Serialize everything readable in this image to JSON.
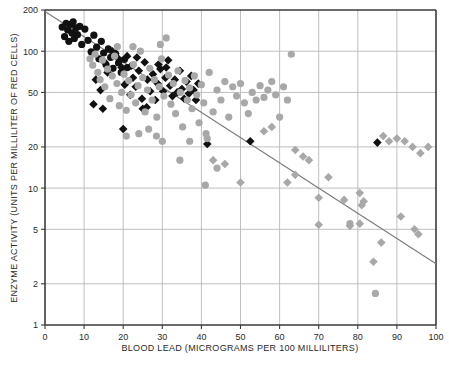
{
  "chart_data": {
    "type": "scatter",
    "title": "",
    "xlabel": "BLOOD LEAD (MICROGRAMS PER 100 MILLILITERS)",
    "ylabel": "ENZYME ACTIVITY (UNITS PER MILLILITER OF RED CELLS)",
    "xscale": "linear",
    "yscale": "log",
    "xlim": [
      0,
      100
    ],
    "ylim": [
      1,
      200
    ],
    "grid": true,
    "legend_position": "none",
    "xticks": [
      0,
      10,
      20,
      30,
      40,
      50,
      60,
      70,
      80,
      90,
      100
    ],
    "xtick_labels": [
      "0",
      "10",
      "20",
      "30",
      "40",
      "50",
      "60",
      "70",
      "80",
      "90",
      "100"
    ],
    "yticks": [
      1,
      2,
      5,
      10,
      20,
      50,
      100,
      200
    ],
    "ytick_labels": [
      "1",
      "2",
      "5",
      "10",
      "20",
      "50",
      "100",
      "200"
    ],
    "colors": {
      "black_marker": "#111111",
      "gray_marker": "#a8a8a8",
      "grid": "#b8b8b8",
      "axis": "#3a3a3a",
      "regression_line": "#7a7a7a",
      "text": "#2b2b2b",
      "background": "#ffffff"
    },
    "annotations": [],
    "regression_line": {
      "name": "fitted regression line",
      "x_start": 0,
      "y_start": 195,
      "x_end": 100,
      "y_end": 2.8
    },
    "series": [
      {
        "name": "black circles",
        "marker": "circle",
        "color": "#111111",
        "points": [
          [
            4.4,
            150
          ],
          [
            5.0,
            128
          ],
          [
            5.4,
            160
          ],
          [
            5.8,
            143
          ],
          [
            6.1,
            118
          ],
          [
            6.6,
            157
          ],
          [
            6.9,
            136
          ],
          [
            7.2,
            164
          ],
          [
            7.5,
            124
          ],
          [
            7.9,
            148
          ],
          [
            8.3,
            132
          ],
          [
            8.9,
            152
          ],
          [
            9.4,
            112
          ],
          [
            10.2,
            145
          ],
          [
            11.0,
            120
          ],
          [
            11.8,
            99
          ],
          [
            12.5,
            131
          ],
          [
            13.2,
            107
          ],
          [
            13.8,
            88
          ],
          [
            14.4,
            118
          ],
          [
            15.0,
            97
          ],
          [
            15.6,
            80
          ],
          [
            16.2,
            104
          ],
          [
            16.8,
            90
          ],
          [
            17.4,
            75
          ],
          [
            18.0,
            96
          ],
          [
            18.8,
            82
          ],
          [
            19.5,
            70
          ],
          [
            20.3,
            87
          ],
          [
            21.0,
            76
          ]
        ]
      },
      {
        "name": "black diamonds",
        "marker": "diamond",
        "color": "#111111",
        "points": [
          [
            13.0,
            62
          ],
          [
            14.2,
            52
          ],
          [
            15.1,
            84
          ],
          [
            16.0,
            70
          ],
          [
            17.2,
            100
          ],
          [
            18.0,
            96
          ],
          [
            18.8,
            88
          ],
          [
            19.6,
            76
          ],
          [
            20.4,
            57
          ],
          [
            21.0,
            92
          ],
          [
            21.8,
            48
          ],
          [
            22.5,
            64
          ],
          [
            23.2,
            55
          ],
          [
            24.0,
            72
          ],
          [
            24.8,
            45
          ],
          [
            25.5,
            83
          ],
          [
            26.2,
            62
          ],
          [
            26.9,
            51
          ],
          [
            27.6,
            68
          ],
          [
            28.2,
            44
          ],
          [
            28.8,
            58
          ],
          [
            29.5,
            74
          ],
          [
            30.2,
            51
          ],
          [
            30.8,
            64
          ],
          [
            31.5,
            86
          ],
          [
            32.0,
            56
          ],
          [
            32.6,
            47
          ],
          [
            33.2,
            62
          ],
          [
            33.8,
            50
          ],
          [
            34.5,
            72
          ],
          [
            35.0,
            53
          ],
          [
            35.6,
            45
          ],
          [
            36.2,
            60
          ],
          [
            36.8,
            49
          ],
          [
            37.4,
            66
          ],
          [
            38.0,
            52
          ],
          [
            38.6,
            44
          ],
          [
            39.2,
            58
          ],
          [
            20.0,
            27
          ],
          [
            25.0,
            38
          ],
          [
            26.0,
            39
          ],
          [
            41.5,
            21
          ],
          [
            52.5,
            22
          ],
          [
            85.0,
            21.5
          ],
          [
            22.0,
            78
          ],
          [
            23.5,
            90
          ],
          [
            29.0,
            80
          ],
          [
            31.0,
            76
          ],
          [
            12.4,
            41
          ],
          [
            14.8,
            38
          ]
        ]
      },
      {
        "name": "gray circles",
        "marker": "circle",
        "color": "#a8a8a8",
        "points": [
          [
            11.5,
            88
          ],
          [
            12.2,
            79
          ],
          [
            12.8,
            95
          ],
          [
            13.5,
            70
          ],
          [
            14.1,
            62
          ],
          [
            14.7,
            86
          ],
          [
            15.3,
            55
          ],
          [
            16.0,
            74
          ],
          [
            16.6,
            45
          ],
          [
            17.2,
            66
          ],
          [
            17.8,
            92
          ],
          [
            18.4,
            58
          ],
          [
            19.0,
            40
          ],
          [
            19.6,
            50
          ],
          [
            20.2,
            68
          ],
          [
            20.8,
            37
          ],
          [
            21.4,
            61
          ],
          [
            22.0,
            48
          ],
          [
            22.6,
            80
          ],
          [
            23.2,
            42
          ],
          [
            23.8,
            56
          ],
          [
            24.4,
            100
          ],
          [
            25.0,
            64
          ],
          [
            25.6,
            36
          ],
          [
            26.2,
            52
          ],
          [
            26.8,
            75
          ],
          [
            27.4,
            44
          ],
          [
            28.0,
            62
          ],
          [
            28.6,
            33
          ],
          [
            29.2,
            55
          ],
          [
            29.8,
            88
          ],
          [
            30.4,
            47
          ],
          [
            31.0,
            125
          ],
          [
            31.6,
            67
          ],
          [
            32.2,
            41
          ],
          [
            32.8,
            58
          ],
          [
            33.4,
            35
          ],
          [
            34.0,
            72
          ],
          [
            34.6,
            50
          ],
          [
            35.2,
            28
          ],
          [
            35.8,
            61
          ],
          [
            36.4,
            44
          ],
          [
            37.0,
            54
          ],
          [
            37.6,
            38
          ],
          [
            38.2,
            66
          ],
          [
            38.8,
            48
          ],
          [
            39.4,
            30
          ],
          [
            40.0,
            57
          ],
          [
            40.6,
            42
          ],
          [
            41.2,
            25
          ],
          [
            42.0,
            70
          ],
          [
            43.0,
            36
          ],
          [
            44.0,
            52
          ],
          [
            45.0,
            44
          ],
          [
            46.0,
            60
          ],
          [
            47.0,
            33
          ],
          [
            48.0,
            55
          ],
          [
            49.0,
            47
          ],
          [
            50.0,
            58
          ],
          [
            51.0,
            42
          ],
          [
            52.0,
            35
          ],
          [
            53.0,
            50
          ],
          [
            54.0,
            44
          ],
          [
            55.0,
            56
          ],
          [
            56.0,
            46
          ],
          [
            57.0,
            52
          ],
          [
            58.0,
            60
          ],
          [
            59.0,
            48
          ],
          [
            60.0,
            33
          ],
          [
            61.0,
            55
          ],
          [
            62.0,
            44
          ],
          [
            63.0,
            95
          ],
          [
            41.0,
            10.5
          ],
          [
            44.0,
            14
          ],
          [
            34.5,
            16
          ],
          [
            30.0,
            22
          ],
          [
            37.0,
            22
          ],
          [
            41.5,
            23
          ],
          [
            28.5,
            24
          ],
          [
            24.0,
            25
          ],
          [
            78.0,
            5.5
          ],
          [
            84.5,
            1.7
          ],
          [
            20.8,
            24
          ],
          [
            26.5,
            27
          ],
          [
            18.5,
            108
          ],
          [
            22.5,
            108
          ],
          [
            29.5,
            112
          ]
        ]
      },
      {
        "name": "gray diamonds",
        "marker": "diamond",
        "color": "#a8a8a8",
        "points": [
          [
            50.0,
            11
          ],
          [
            62.0,
            11
          ],
          [
            64.0,
            12.5
          ],
          [
            70.0,
            8.5
          ],
          [
            72.5,
            12
          ],
          [
            76.5,
            8.2
          ],
          [
            80.5,
            9.2
          ],
          [
            81.0,
            7.5
          ],
          [
            81.5,
            8.0
          ],
          [
            70.0,
            5.4
          ],
          [
            78.0,
            5.3
          ],
          [
            80.5,
            5.5
          ],
          [
            86.0,
            4.0
          ],
          [
            84.0,
            2.9
          ],
          [
            91.0,
            6.2
          ],
          [
            94.5,
            5.0
          ],
          [
            95.5,
            4.6
          ],
          [
            64.0,
            19
          ],
          [
            66.0,
            17
          ],
          [
            67.5,
            16
          ],
          [
            88.0,
            22
          ],
          [
            90.0,
            23
          ],
          [
            92.0,
            22
          ],
          [
            94.0,
            20
          ],
          [
            96.0,
            18
          ],
          [
            98.0,
            20
          ],
          [
            86.5,
            24
          ],
          [
            43.0,
            16
          ],
          [
            46.0,
            15
          ],
          [
            56.0,
            26
          ],
          [
            58.0,
            28
          ]
        ]
      }
    ]
  }
}
